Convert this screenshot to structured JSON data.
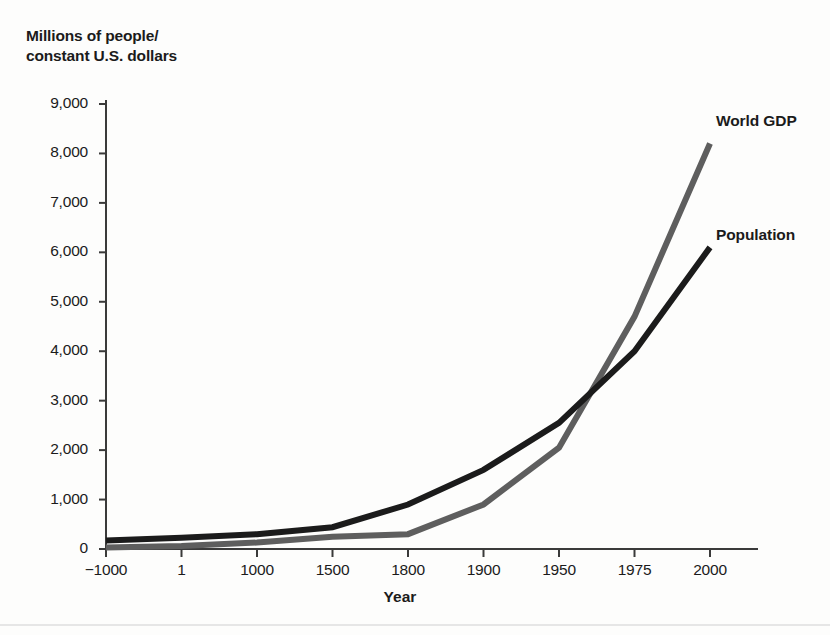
{
  "figure": {
    "y_axis_title": "Millions of people/\nconstant U.S. dollars",
    "x_axis_title": "Year"
  },
  "chart_data": {
    "type": "line",
    "title": "",
    "xlabel": "Year",
    "ylabel": "Millions of people/ constant U.S. dollars",
    "categories": [
      "−1000",
      "1",
      "1000",
      "1500",
      "1800",
      "1900",
      "1950",
      "1975",
      "2000"
    ],
    "x_tick_labels": [
      "−1000",
      "1",
      "1000",
      "1500",
      "1800",
      "1900",
      "1950",
      "1975",
      "2000"
    ],
    "y_tick_labels": [
      "0",
      "1,000",
      "2,000",
      "3,000",
      "4,000",
      "5,000",
      "6,000",
      "7,000",
      "8,000",
      "9,000"
    ],
    "y_ticks": [
      0,
      1000,
      2000,
      3000,
      4000,
      5000,
      6000,
      7000,
      8000,
      9000
    ],
    "ylim": [
      0,
      9000
    ],
    "grid": false,
    "legend_position": "right-inline-labels",
    "series": [
      {
        "name": "World GDP",
        "color": "#5e5e5e",
        "values": [
          30,
          60,
          130,
          250,
          300,
          900,
          2050,
          4700,
          8200
        ]
      },
      {
        "name": "Population",
        "color": "#1b1b1b",
        "values": [
          170,
          230,
          300,
          440,
          900,
          1600,
          2550,
          4000,
          6100
        ]
      }
    ]
  },
  "colors": {
    "world_gdp": "#5e5e5e",
    "population": "#1b1b1b",
    "axis": "#3a3a3a",
    "text": "#1b1b1b",
    "background": "#fdfdfc"
  }
}
